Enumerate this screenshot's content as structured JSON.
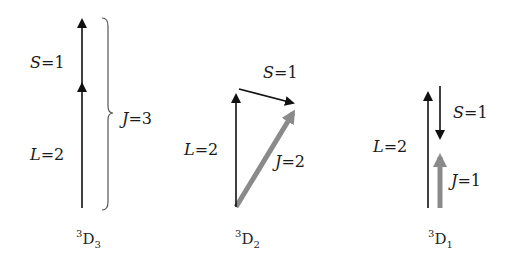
{
  "colors": {
    "vector_black": "#111111",
    "vector_total_gray": "#8a8a8a",
    "brace": "#555555",
    "text": "#1a1a1a"
  },
  "panels": [
    {
      "term": {
        "multiplicity": "3",
        "letter": "D",
        "j": "3"
      },
      "labels": {
        "S": "S",
        "S_val": "=1",
        "L": "L",
        "L_val": "=2",
        "J": "J",
        "J_val": "=3"
      },
      "description": "L and S parallel, J = L + S = 3 (brace)"
    },
    {
      "term": {
        "multiplicity": "3",
        "letter": "D",
        "j": "2"
      },
      "labels": {
        "S": "S",
        "S_val": "=1",
        "L": "L",
        "L_val": "=2",
        "J": "J",
        "J_val": "=2"
      },
      "description": "S perpendicular-ish to L, J = 2 (gray diagonal)"
    },
    {
      "term": {
        "multiplicity": "3",
        "letter": "D",
        "j": "1"
      },
      "labels": {
        "S": "S",
        "S_val": "=1",
        "L": "L",
        "L_val": "=2",
        "J": "J",
        "J_val": "=1"
      },
      "description": "S antiparallel to L, J = 1 (gray short)"
    }
  ]
}
